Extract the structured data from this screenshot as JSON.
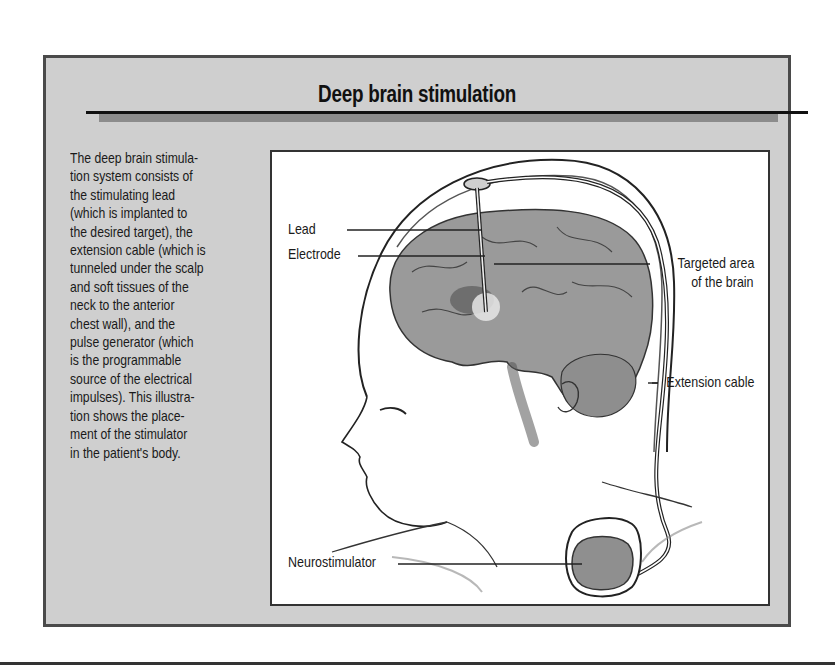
{
  "figure": {
    "title": "Deep brain stimulation",
    "caption_lines": [
      "The deep brain stimula-",
      "tion system consists of",
      "the stimulating lead",
      "(which is implanted to",
      "the desired target), the",
      "extension cable (which is",
      "tunneled under the scalp",
      "and soft tissues of the",
      "neck to the anterior",
      "chest wall), and the",
      "pulse generator (which",
      "is  the programmable",
      "source of the electrical",
      "impulses). This illustra-",
      "tion shows the place-",
      "ment of the stimulator",
      "in the patient's body."
    ],
    "labels": {
      "lead": "Lead",
      "electrode": "Electrode",
      "targeted_area_line1": "Targeted area",
      "targeted_area_line2": "of the brain",
      "extension_cable": "Extension cable",
      "neurostimulator": "Neurostimulator"
    },
    "colors": {
      "box_background": "#cfcfcf",
      "border": "#4a4a4a",
      "brain": "#9a9a9a",
      "panel": "#ffffff"
    }
  }
}
